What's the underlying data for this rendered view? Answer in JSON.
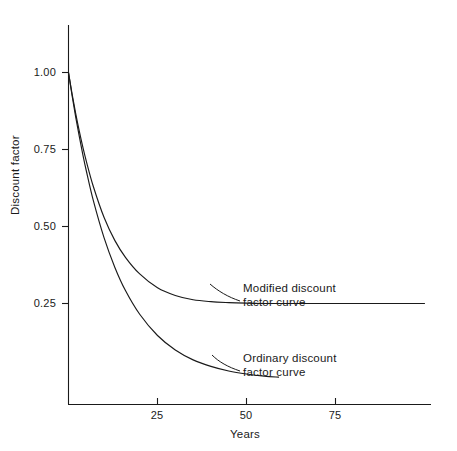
{
  "figure": {
    "background_color": "#ffffff",
    "line_color": "#1a1a1a",
    "axis_color": "#1a1a1a"
  },
  "axes": {
    "x_title": "Years",
    "y_title": "Discount factor",
    "x_ticks": [
      "25",
      "50",
      "75"
    ],
    "y_ticks": [
      "1.00",
      "0.75",
      "0.50",
      "0.25"
    ]
  },
  "annotations": {
    "modified": {
      "line1": "Modified discount",
      "line2": "factor curve"
    },
    "ordinary": {
      "line1": "Ordinary discount",
      "line2": "factor curve"
    }
  },
  "chart_data": {
    "type": "line",
    "title": "",
    "xlabel": "Years",
    "ylabel": "Discount factor",
    "xlim": [
      0,
      102
    ],
    "ylim": [
      0,
      1.08
    ],
    "xticks": [
      25,
      50,
      75
    ],
    "yticks": [
      0.25,
      0.5,
      0.75,
      1.0
    ],
    "grid": false,
    "legend": "none (curves labelled by in-plot annotations)",
    "series": [
      {
        "name": "Modified discount factor curve",
        "annotation": "Modified discount factor curve",
        "description": "Exponential decay approaching an asymptote of 0.25",
        "x": [
          0,
          1,
          2,
          3,
          4,
          5,
          7,
          10,
          13,
          16,
          20,
          25,
          30,
          35,
          40,
          45,
          50,
          55,
          60,
          70,
          80,
          90,
          100
        ],
        "y": [
          1.0,
          0.931,
          0.868,
          0.811,
          0.759,
          0.712,
          0.629,
          0.529,
          0.455,
          0.4,
          0.346,
          0.301,
          0.276,
          0.262,
          0.256,
          0.253,
          0.251,
          0.25,
          0.25,
          0.25,
          0.25,
          0.25,
          0.25
        ]
      },
      {
        "name": "Ordinary discount factor curve",
        "annotation": "Ordinary discount factor curve",
        "description": "Exponential decay toward zero, drawn to about year 59",
        "x": [
          0,
          1,
          2,
          3,
          4,
          5,
          7,
          10,
          13,
          16,
          20,
          25,
          30,
          35,
          40,
          45,
          50,
          55,
          59
        ],
        "y": [
          1.0,
          0.926,
          0.857,
          0.794,
          0.735,
          0.681,
          0.583,
          0.463,
          0.368,
          0.292,
          0.215,
          0.146,
          0.099,
          0.067,
          0.046,
          0.031,
          0.021,
          0.014,
          0.011
        ]
      }
    ]
  }
}
